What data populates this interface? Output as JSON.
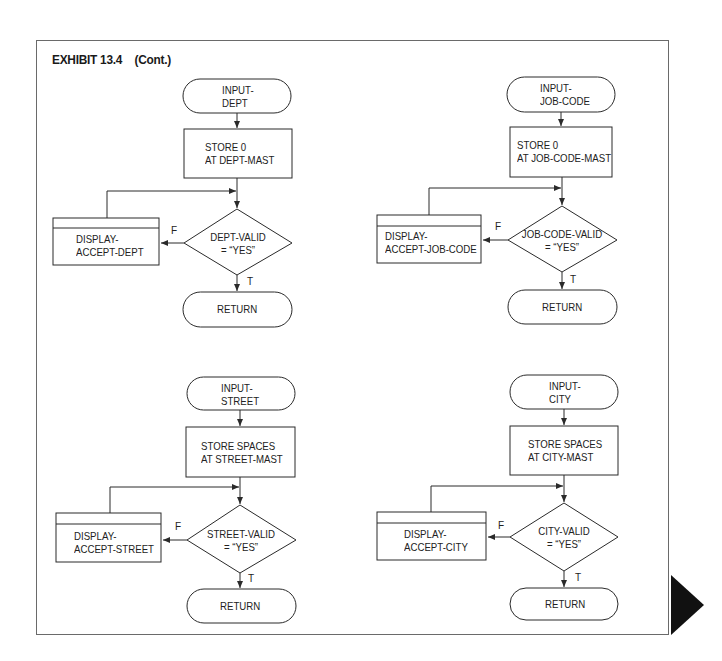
{
  "title": {
    "exhibit": "EXHIBIT 13.4",
    "suffix": "(Cont.)"
  },
  "flowcharts": [
    {
      "id": "dept",
      "start": "INPUT-\nDEPT",
      "process": "STORE 0\nAT DEPT-MAST",
      "decision": "DEPT-VALID\n= “YES”",
      "predefined": "DISPLAY-\nACCEPT-DEPT",
      "false_label": "F",
      "true_label": "T",
      "end": "RETURN"
    },
    {
      "id": "job-code",
      "start": "INPUT-\nJOB-CODE",
      "process": "STORE 0\nAT JOB-CODE-MAST",
      "decision": "JOB-CODE-VALID\n= “YES”",
      "predefined": "DISPLAY-\nACCEPT-JOB-CODE",
      "false_label": "F",
      "true_label": "T",
      "end": "RETURN"
    },
    {
      "id": "street",
      "start": "INPUT-\nSTREET",
      "process": "STORE SPACES\nAT STREET-MAST",
      "decision": "STREET-VALID\n= “YES”",
      "predefined": "DISPLAY-\nACCEPT-STREET",
      "false_label": "F",
      "true_label": "T",
      "end": "RETURN"
    },
    {
      "id": "city",
      "start": "INPUT-\nCITY",
      "process": "STORE SPACES\nAT CITY-MAST",
      "decision": "CITY-VALID\n= “YES”",
      "predefined": "DISPLAY-\nACCEPT-CITY",
      "false_label": "F",
      "true_label": "T",
      "end": "RETURN"
    }
  ],
  "colors": {
    "line": "#2a2a2a",
    "frame": "#6a6a6a",
    "marker": "#111111"
  },
  "page_marker": "continue-triangle"
}
